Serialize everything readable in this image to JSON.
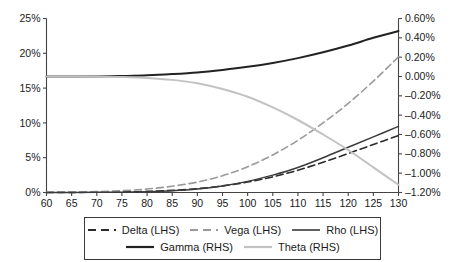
{
  "chart_data": {
    "type": "line",
    "title": "",
    "xlabel": "",
    "ylabel": "",
    "grid": false,
    "legend_position": "bottom",
    "xlim": [
      60,
      130
    ],
    "x_ticks": [
      60,
      65,
      70,
      75,
      80,
      85,
      90,
      95,
      100,
      105,
      110,
      115,
      120,
      125,
      130
    ],
    "x_tick_labels": [
      "60",
      "65",
      "70",
      "75",
      "80",
      "85",
      "90",
      "95",
      "100",
      "105",
      "110",
      "115",
      "120",
      "125",
      "130"
    ],
    "left_axis": {
      "label": "",
      "ylim": [
        0,
        25
      ],
      "ticks": [
        0,
        5,
        10,
        15,
        20,
        25
      ],
      "tick_labels": [
        "0%",
        "5%",
        "10%",
        "15%",
        "20%",
        "25%"
      ]
    },
    "right_axis": {
      "label": "",
      "ylim": [
        -1.2,
        0.6
      ],
      "ticks": [
        -1.2,
        -1.0,
        -0.8,
        -0.6,
        -0.4,
        -0.2,
        0.0,
        0.2,
        0.4,
        0.6
      ],
      "tick_labels": [
        "-1.20%",
        "-1.00%",
        "-0.80%",
        "-0.60%",
        "-0.40%",
        "-0.20%",
        "0.00%",
        "0.20%",
        "0.40%",
        "0.60%"
      ]
    },
    "x": [
      60,
      65,
      70,
      75,
      80,
      85,
      90,
      95,
      100,
      105,
      110,
      115,
      120,
      125,
      130
    ],
    "series": [
      {
        "name": "Delta (LHS)",
        "axis": "left",
        "style": "dashed",
        "color": "#2b2b2b",
        "width": 1.6,
        "dash": "7,4",
        "values": [
          0.01,
          0.02,
          0.04,
          0.08,
          0.16,
          0.3,
          0.55,
          0.95,
          1.5,
          2.25,
          3.2,
          4.35,
          5.6,
          6.9,
          8.2
        ]
      },
      {
        "name": "Vega (LHS)",
        "axis": "left",
        "style": "dashed",
        "color": "#9a9a9a",
        "width": 1.6,
        "dash": "7,4",
        "values": [
          0.02,
          0.05,
          0.12,
          0.26,
          0.5,
          0.9,
          1.5,
          2.4,
          3.7,
          5.4,
          7.5,
          10.0,
          12.8,
          16.0,
          19.5
        ]
      },
      {
        "name": "Rho (LHS)",
        "axis": "left",
        "style": "solid",
        "color": "#3a3a3a",
        "width": 1.5,
        "dash": "",
        "values": [
          0.0,
          0.01,
          0.02,
          0.05,
          0.12,
          0.25,
          0.5,
          0.95,
          1.6,
          2.5,
          3.6,
          5.0,
          6.5,
          8.0,
          9.5
        ]
      },
      {
        "name": "Gamma (RHS)",
        "axis": "right",
        "style": "solid",
        "color": "#222222",
        "width": 2.0,
        "dash": "",
        "values": [
          0.0,
          0.0,
          0.0,
          0.005,
          0.012,
          0.025,
          0.042,
          0.068,
          0.1,
          0.14,
          0.19,
          0.25,
          0.32,
          0.4,
          0.47
        ]
      },
      {
        "name": "Theta (RHS)",
        "axis": "right",
        "style": "solid",
        "color": "#c2c2c2",
        "width": 2.0,
        "dash": "",
        "values": [
          0.0,
          0.0,
          -0.002,
          -0.006,
          -0.015,
          -0.035,
          -0.07,
          -0.13,
          -0.21,
          -0.32,
          -0.45,
          -0.6,
          -0.76,
          -0.94,
          -1.12
        ]
      }
    ],
    "legend": [
      {
        "label": "Delta (LHS)",
        "style": "dashed",
        "color": "#2b2b2b",
        "width": 1.8
      },
      {
        "label": "Vega (LHS)",
        "style": "dashed",
        "color": "#9a9a9a",
        "width": 1.8
      },
      {
        "label": "Rho (LHS)",
        "style": "solid",
        "color": "#3a3a3a",
        "width": 1.6
      },
      {
        "label": "Gamma (RHS)",
        "style": "solid",
        "color": "#222222",
        "width": 2.2
      },
      {
        "label": "Theta (RHS)",
        "style": "solid",
        "color": "#c2c2c2",
        "width": 2.2
      }
    ]
  }
}
